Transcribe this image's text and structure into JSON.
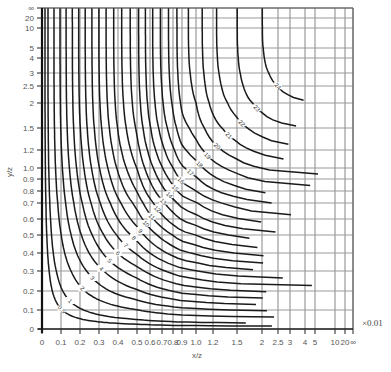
{
  "chart_data": {
    "type": "line",
    "title": "",
    "xlabel": "x/z",
    "ylabel": "y/z",
    "unit_note": "×0.01",
    "x_ticks": [
      "0",
      "0.1",
      "0.2",
      "0.3",
      "0.4",
      "0.5",
      "0.6",
      "0.7",
      "0.8",
      "0.9",
      "1.0",
      "1.2",
      "1.5",
      "2",
      "2.5",
      "3",
      "4",
      "5",
      "10",
      "20",
      "∞"
    ],
    "x_tick_values": [
      0,
      0.1,
      0.2,
      0.3,
      0.4,
      0.5,
      0.6,
      0.7,
      0.8,
      0.9,
      1.0,
      1.2,
      1.5,
      2,
      2.5,
      3,
      4,
      5,
      10,
      20,
      1000
    ],
    "x_tick_px": [
      42,
      61,
      80,
      99,
      118,
      137,
      150,
      162,
      173,
      182,
      196,
      213,
      237,
      262,
      278,
      290,
      305,
      315,
      335,
      345,
      353
    ],
    "y_ticks": [
      "0",
      "0.1",
      "0.2",
      "0.3",
      "0.4",
      "0.5",
      "0.6",
      "0.7",
      "0.8",
      "0.9",
      "1.0",
      "1.2",
      "1.5",
      "2",
      "2.5",
      "3",
      "4",
      "5",
      "10",
      "20",
      "∞"
    ],
    "y_tick_values": [
      0,
      0.1,
      0.2,
      0.3,
      0.4,
      0.5,
      0.6,
      0.7,
      0.8,
      0.9,
      1.0,
      1.2,
      1.5,
      2,
      2.5,
      3,
      4,
      5,
      10,
      20,
      1000
    ],
    "y_tick_px": [
      329,
      310,
      291,
      271,
      253,
      235,
      219,
      203,
      191,
      179,
      168,
      150,
      128,
      103,
      86,
      73,
      58,
      48,
      28,
      18,
      8
    ],
    "contour_levels": [
      0.5,
      1,
      2,
      3,
      4,
      5,
      6,
      7,
      8,
      9,
      10,
      11,
      12,
      13,
      14,
      15,
      16,
      17,
      18,
      19,
      20,
      21,
      22,
      23,
      24
    ],
    "contour_labels": [
      "0.5",
      "1",
      "2",
      "3",
      "4",
      "5",
      "6",
      "7",
      "8",
      "9",
      "10",
      "11",
      "12",
      "13",
      "14",
      "15",
      "16",
      "17",
      "18",
      "19",
      "20",
      "21",
      "22",
      "23",
      "24"
    ],
    "plot_area": {
      "left": 42,
      "right": 353,
      "top": 8,
      "bottom": 329
    },
    "grid": true
  }
}
